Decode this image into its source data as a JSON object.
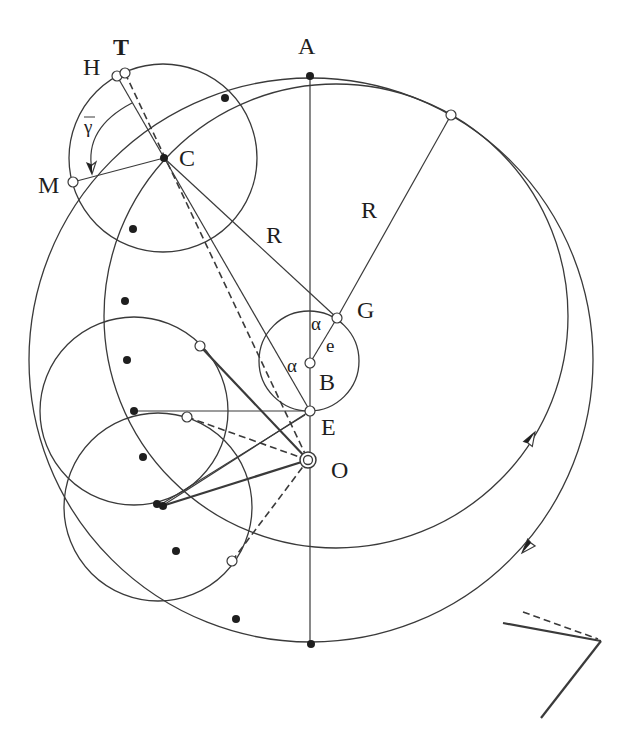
{
  "figure": {
    "colors": {
      "stroke": "#3a3a3a",
      "text": "#1e1e1e",
      "background": "#ffffff",
      "dot_fill": "#1e1e1e",
      "open_fill": "#ffffff"
    },
    "labels": {
      "A": "A",
      "T": "T",
      "H": "H",
      "C": "C",
      "M": "M",
      "R_upper_right": "R",
      "R_left": "R",
      "G": "G",
      "alpha_upper": "α",
      "alpha_left": "α",
      "e": "e",
      "B": "B",
      "E": "E",
      "O": "O",
      "gamma_bar": "γ"
    }
  },
  "geometry": {
    "circles": [
      {
        "name": "outer-eccentric-circle",
        "cx": 311,
        "cy": 360,
        "r": 282
      },
      {
        "name": "deferent-circle-centered-g",
        "cx": 336,
        "cy": 316,
        "r": 232
      },
      {
        "name": "epicycle-at-c",
        "cx": 163,
        "cy": 158,
        "r": 94
      },
      {
        "name": "epicycle-middle",
        "cx": 134,
        "cy": 411,
        "r": 94
      },
      {
        "name": "epicycle-lower",
        "cx": 158,
        "cy": 507,
        "r": 94
      },
      {
        "name": "eccentricity-circle-at-b",
        "cx": 309,
        "cy": 361,
        "r": 50
      }
    ],
    "lines": [
      {
        "name": "axis-line-a-to-bottom",
        "x1": 310,
        "y1": 76,
        "x2": 310,
        "y2": 644,
        "style": "thin"
      },
      {
        "name": "line-h-c-e",
        "x1": 117,
        "y1": 76,
        "x2": 310,
        "y2": 411,
        "style": "thin"
      },
      {
        "name": "line-c-m",
        "x1": 164,
        "y1": 158,
        "x2": 73,
        "y2": 182,
        "style": "thin"
      },
      {
        "name": "radius-line-c-g",
        "x1": 164,
        "y1": 158,
        "x2": 337,
        "y2": 318,
        "style": "thin"
      },
      {
        "name": "radius-line-g-top",
        "x1": 337,
        "y1": 318,
        "x2": 451,
        "y2": 115,
        "style": "thin"
      },
      {
        "name": "eccentricity-line-b-g",
        "x1": 310,
        "y1": 363,
        "x2": 337,
        "y2": 318,
        "style": "thin"
      },
      {
        "name": "horizontal-line-to-e",
        "x1": 134,
        "y1": 411,
        "x2": 310,
        "y2": 411,
        "style": "thin"
      },
      {
        "name": "line-lower-center-to-e",
        "x1": 162,
        "y1": 506,
        "x2": 310,
        "y2": 411,
        "style": "thin"
      },
      {
        "name": "line-lower-center-to-e-2",
        "x1": 160,
        "y1": 505,
        "x2": 305,
        "y2": 415,
        "style": "thin"
      },
      {
        "name": "line-upper-point-to-o",
        "x1": 200,
        "y1": 346,
        "x2": 308,
        "y2": 460,
        "style": "thick"
      },
      {
        "name": "line-lower-center-to-o",
        "x1": 162,
        "y1": 506,
        "x2": 308,
        "y2": 460,
        "style": "thick"
      },
      {
        "name": "dashed-line-t-to-o",
        "x1": 125,
        "y1": 73,
        "x2": 308,
        "y2": 460,
        "style": "dashed"
      },
      {
        "name": "dashed-line-mid-point-to-o",
        "x1": 187,
        "y1": 417,
        "x2": 308,
        "y2": 460,
        "style": "dashed"
      },
      {
        "name": "dashed-line-low-point-to-o",
        "x1": 232,
        "y1": 561,
        "x2": 308,
        "y2": 460,
        "style": "dashed"
      },
      {
        "name": "corner-line-solid-a",
        "x1": 503,
        "y1": 623,
        "x2": 601,
        "y2": 641,
        "style": "thick"
      },
      {
        "name": "corner-line-solid-b",
        "x1": 601,
        "y1": 641,
        "x2": 541,
        "y2": 718,
        "style": "thick"
      },
      {
        "name": "corner-line-dashed",
        "x1": 523,
        "y1": 612,
        "x2": 598,
        "y2": 639,
        "style": "dashed"
      }
    ],
    "filled_points": [
      {
        "name": "point-a",
        "x": 310,
        "y": 76
      },
      {
        "name": "point-c",
        "x": 164,
        "y": 158
      },
      {
        "name": "track-dot-1",
        "x": 225,
        "y": 98
      },
      {
        "name": "track-dot-2",
        "x": 133,
        "y": 229
      },
      {
        "name": "track-dot-3",
        "x": 125,
        "y": 301
      },
      {
        "name": "track-dot-4",
        "x": 127,
        "y": 360
      },
      {
        "name": "track-dot-5",
        "x": 134,
        "y": 411
      },
      {
        "name": "track-dot-6",
        "x": 143,
        "y": 457
      },
      {
        "name": "track-dot-7a",
        "x": 157,
        "y": 504
      },
      {
        "name": "track-dot-7b",
        "x": 163,
        "y": 506
      },
      {
        "name": "track-dot-8",
        "x": 176,
        "y": 551
      },
      {
        "name": "track-dot-9",
        "x": 236,
        "y": 619
      },
      {
        "name": "bottom-point",
        "x": 311,
        "y": 644
      }
    ],
    "open_points": [
      {
        "name": "point-h",
        "x": 117,
        "y": 76
      },
      {
        "name": "point-t",
        "x": 125,
        "y": 73
      },
      {
        "name": "point-m",
        "x": 73,
        "y": 182
      },
      {
        "name": "point-top-right",
        "x": 451,
        "y": 115
      },
      {
        "name": "point-g",
        "x": 337,
        "y": 318
      },
      {
        "name": "point-b",
        "x": 310,
        "y": 363
      },
      {
        "name": "point-e",
        "x": 310,
        "y": 411
      },
      {
        "name": "epicycle-point-upper",
        "x": 200,
        "y": 346
      },
      {
        "name": "epicycle-point-middle",
        "x": 187,
        "y": 417
      },
      {
        "name": "epicycle-point-lower",
        "x": 232,
        "y": 561
      }
    ],
    "center_o": {
      "name": "point-o",
      "x": 308,
      "y": 460,
      "r_outer": 8,
      "r_inner": 4.5
    },
    "gamma_arc": {
      "name": "gamma-angle-arc",
      "d": "M 132 103 Q 84 128 92 170"
    },
    "arrowheads": [
      {
        "name": "direction-arrow-up-icon",
        "tip": [
          535,
          432
        ],
        "left": [
          532.3,
          446.5
        ],
        "right": [
          523.7,
          441.5
        ],
        "mid": [
          528,
          443
        ]
      },
      {
        "name": "direction-arrow-down-icon",
        "tip": [
          522,
          553
        ],
        "left": [
          535.1,
          546
        ],
        "right": [
          527.7,
          539.2
        ],
        "mid": [
          531,
          543
        ]
      },
      {
        "name": "gamma-arrow-icon",
        "tip": [
          92,
          174
        ],
        "left": [
          96,
          162
        ],
        "right": [
          87,
          163
        ],
        "mid": [
          92,
          165
        ]
      }
    ]
  }
}
